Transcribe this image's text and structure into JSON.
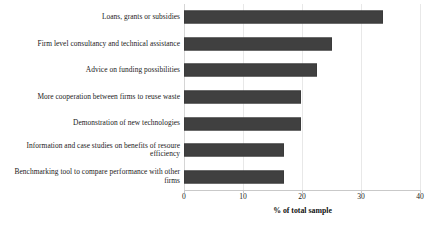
{
  "chart_data": {
    "type": "bar",
    "orientation": "horizontal",
    "title": "",
    "xlabel": "% of total sample",
    "ylabel": "",
    "xlim": [
      0,
      40
    ],
    "xticks": [
      0,
      10,
      20,
      30,
      40
    ],
    "grid": true,
    "legend": null,
    "bar_color": "#404040",
    "categories": [
      "Loans, grants or subsidies",
      "Firm level consultancy and technical assistance",
      "Advice on funding possibilities",
      "More cooperation between firms to reuse waste",
      "Demonstration of new technologies",
      "Information and case studies on benefits of resoure efficiency",
      "Benchmarking tool to compare performance with other firms"
    ],
    "values": [
      33.7,
      25.1,
      22.5,
      19.8,
      19.8,
      17.0,
      17.0
    ]
  },
  "axis": {
    "x_title": "% of total sample",
    "tick_labels": [
      "0",
      "10",
      "20",
      "30",
      "40"
    ]
  }
}
